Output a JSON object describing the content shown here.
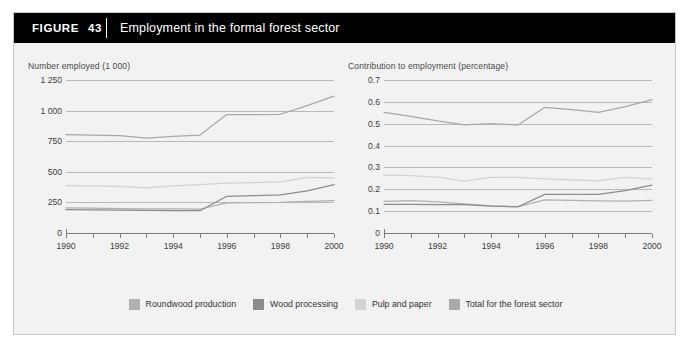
{
  "figure": {
    "badge_label": "FIGURE",
    "badge_number": "43",
    "title": "Employment in the formal forest sector"
  },
  "legend": {
    "items": [
      {
        "label": "Roundwood production",
        "color": "#b0b0b0"
      },
      {
        "label": "Wood processing",
        "color": "#8c8c8c"
      },
      {
        "label": "Pulp and paper",
        "color": "#d2d2d2"
      },
      {
        "label": "Total for the forest sector",
        "color": "#a8a8a8"
      }
    ]
  },
  "chart_data": [
    {
      "type": "line",
      "title": "Number employed (1 000)",
      "xlabel": "",
      "ylabel": "Number employed (1 000)",
      "x": [
        1990,
        1991,
        1992,
        1993,
        1994,
        1995,
        1996,
        1997,
        1998,
        1999,
        2000
      ],
      "xlim": [
        1990,
        2000
      ],
      "ylim": [
        0,
        1250
      ],
      "yticks": [
        0,
        250,
        500,
        750,
        1000,
        1250
      ],
      "ytick_labels": [
        "0",
        "250",
        "500",
        "750",
        "1 000",
        "1 250"
      ],
      "xticks": [
        1990,
        1991,
        1992,
        1993,
        1994,
        1995,
        1996,
        1997,
        1998,
        1999,
        2000
      ],
      "xtick_labels": [
        "1990",
        "",
        "1992",
        "",
        "1994",
        "",
        "1996",
        "",
        "1998",
        "",
        "2000"
      ],
      "grid": true,
      "legend_position": "bottom",
      "series": [
        {
          "name": "Roundwood production",
          "color": "#b0b0b0",
          "values": [
            205,
            203,
            200,
            198,
            197,
            196,
            246,
            248,
            250,
            258,
            265
          ]
        },
        {
          "name": "Wood processing",
          "color": "#8c8c8c",
          "values": [
            190,
            188,
            186,
            184,
            183,
            182,
            300,
            305,
            312,
            345,
            395
          ]
        },
        {
          "name": "Pulp and paper",
          "color": "#d2d2d2",
          "values": [
            388,
            385,
            380,
            368,
            385,
            395,
            408,
            412,
            418,
            455,
            450
          ]
        },
        {
          "name": "Total for the forest sector",
          "color": "#a8a8a8",
          "values": [
            803,
            800,
            795,
            775,
            790,
            800,
            968,
            968,
            970,
            1040,
            1118
          ]
        }
      ]
    },
    {
      "type": "line",
      "title": "Contribution to employment (percentage)",
      "xlabel": "",
      "ylabel": "Contribution to employment (percentage)",
      "x": [
        1990,
        1991,
        1992,
        1993,
        1994,
        1995,
        1996,
        1997,
        1998,
        1999,
        2000
      ],
      "xlim": [
        1990,
        2000
      ],
      "ylim": [
        0,
        0.7
      ],
      "yticks": [
        0,
        0.1,
        0.2,
        0.3,
        0.4,
        0.5,
        0.6,
        0.7
      ],
      "ytick_labels": [
        "0",
        "0.1",
        "0.2",
        "0.3",
        "0.4",
        "0.5",
        "0.6",
        "0.7"
      ],
      "xticks": [
        1990,
        1991,
        1992,
        1993,
        1994,
        1995,
        1996,
        1997,
        1998,
        1999,
        2000
      ],
      "xtick_labels": [
        "1990",
        "",
        "1992",
        "",
        "1994",
        "",
        "1996",
        "",
        "1998",
        "",
        "2000"
      ],
      "grid": true,
      "legend_position": "bottom",
      "series": [
        {
          "name": "Roundwood production",
          "color": "#b0b0b0",
          "values": [
            0.145,
            0.148,
            0.142,
            0.133,
            0.124,
            0.121,
            0.152,
            0.149,
            0.147,
            0.146,
            0.149
          ]
        },
        {
          "name": "Wood processing",
          "color": "#8c8c8c",
          "values": [
            0.131,
            0.131,
            0.13,
            0.13,
            0.123,
            0.12,
            0.177,
            0.177,
            0.177,
            0.194,
            0.219
          ]
        },
        {
          "name": "Pulp and paper",
          "color": "#d2d2d2",
          "values": [
            0.265,
            0.262,
            0.256,
            0.237,
            0.255,
            0.255,
            0.248,
            0.243,
            0.238,
            0.255,
            0.247
          ]
        },
        {
          "name": "Total for the forest sector",
          "color": "#a8a8a8",
          "values": [
            0.552,
            0.534,
            0.513,
            0.495,
            0.501,
            0.494,
            0.575,
            0.564,
            0.552,
            0.578,
            0.61
          ]
        }
      ]
    }
  ]
}
